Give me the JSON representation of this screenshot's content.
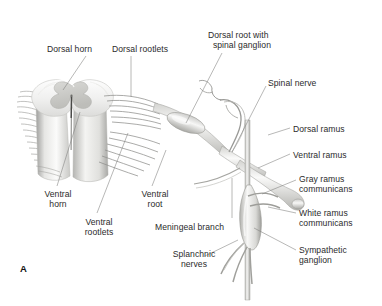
{
  "figure": {
    "panel_id": "A",
    "title_implicit": "Spinal cord segment with spinal nerve and sympathetic ganglion",
    "background_color": "#ffffff",
    "text_color": "#2b2b2b",
    "line_color": "#8a8a8a"
  },
  "labels": [
    {
      "id": "dorsal-horn",
      "text": "Dorsal horn",
      "x": 47,
      "y": 44,
      "align": "left"
    },
    {
      "id": "dorsal-rootlets",
      "text": "Dorsal rootlets",
      "x": 112,
      "y": 44,
      "align": "left"
    },
    {
      "id": "dorsal-root-spinal-ganglion",
      "text": "Dorsal root with\n  spinal ganglion",
      "x": 208,
      "y": 30,
      "align": "left"
    },
    {
      "id": "spinal-nerve",
      "text": "Spinal nerve",
      "x": 268,
      "y": 78,
      "align": "left"
    },
    {
      "id": "dorsal-ramus",
      "text": "Dorsal ramus",
      "x": 293,
      "y": 124,
      "align": "left"
    },
    {
      "id": "ventral-ramus",
      "text": "Ventral ramus",
      "x": 293,
      "y": 150,
      "align": "left"
    },
    {
      "id": "gray-ramus-communicans",
      "text": "Gray ramus\ncommunicans",
      "x": 299,
      "y": 174,
      "align": "left"
    },
    {
      "id": "white-ramus-communicans",
      "text": "White ramus\ncommunicans",
      "x": 299,
      "y": 208,
      "align": "left"
    },
    {
      "id": "sympathetic-ganglion",
      "text": "Sympathetic\nganglion",
      "x": 299,
      "y": 245,
      "align": "left"
    },
    {
      "id": "ventral-horn",
      "text": "Ventral\nhorn",
      "x": 33,
      "y": 189,
      "align": "left"
    },
    {
      "id": "ventral-rootlets",
      "text": "Ventral\nrootlets",
      "x": 72,
      "y": 217,
      "align": "left"
    },
    {
      "id": "ventral-root",
      "text": "Ventral\nroot",
      "x": 134,
      "y": 189,
      "align": "left"
    },
    {
      "id": "meningeal-branch",
      "text": "Meningeal branch",
      "x": 155,
      "y": 222,
      "align": "left"
    },
    {
      "id": "splanchnic-nerves",
      "text": "Splanchnic\nnerves",
      "x": 164,
      "y": 249,
      "align": "left"
    }
  ],
  "anatomy_parts": [
    "spinal-cord-segment",
    "gray-matter-butterfly",
    "central-canal",
    "dorsal-rootlet-bundle",
    "ventral-rootlet-bundle",
    "spinal-ganglion-swelling",
    "spinal-nerve-trunk",
    "dorsal-ramus-branch",
    "ventral-ramus-branch",
    "gray-ramus-communicans-branch",
    "white-ramus-communicans-branch",
    "sympathetic-trunk",
    "sympathetic-ganglion-body",
    "splanchnic-nerve-branches",
    "meningeal-branch-line"
  ]
}
